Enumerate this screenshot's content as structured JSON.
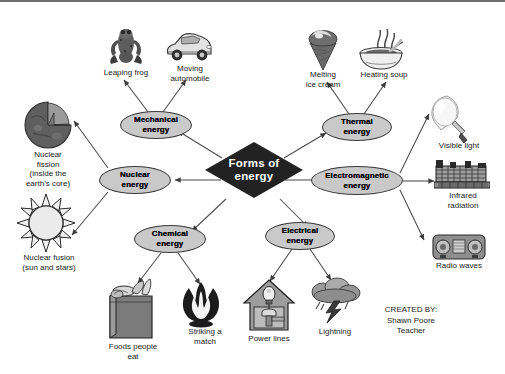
{
  "diagram": {
    "title": "Forms of energy",
    "center": {
      "label": "Forms of energy"
    },
    "branches": [
      {
        "id": "mechanical",
        "label": "Mechanical energy",
        "examples": [
          {
            "id": "leaping-frog",
            "caption": "Leaping frog",
            "icon": "frog-icon"
          },
          {
            "id": "moving-automobile",
            "caption": "Moving automobile",
            "icon": "car-icon"
          }
        ]
      },
      {
        "id": "thermal",
        "label": "Thermal energy",
        "examples": [
          {
            "id": "melting-ice-cream",
            "caption": "Melting ice cream",
            "icon": "ice-cream-cone-icon"
          },
          {
            "id": "heating-soup",
            "caption": "Heating soup",
            "icon": "soup-bowl-icon"
          }
        ]
      },
      {
        "id": "nuclear",
        "label": "Nuclear energy",
        "examples": [
          {
            "id": "nuclear-fission",
            "caption": "Nuclear fission (inside the earth's core)",
            "icon": "earth-cutaway-icon"
          },
          {
            "id": "nuclear-fusion",
            "caption": "Nuclear fusion (sun and stars)",
            "icon": "sun-icon"
          }
        ]
      },
      {
        "id": "electromagnetic",
        "label": "Electromagnetic energy",
        "examples": [
          {
            "id": "visible-light",
            "caption": "Visible light",
            "icon": "light-bulb-icon"
          },
          {
            "id": "infrared-radiation",
            "caption": "Infrared radiation",
            "icon": "space-heater-icon"
          },
          {
            "id": "radio-waves",
            "caption": "Radio waves",
            "icon": "radio-icon"
          }
        ]
      },
      {
        "id": "chemical",
        "label": "Chemical energy",
        "examples": [
          {
            "id": "foods-people-eat",
            "caption": "Foods people eat",
            "icon": "grocery-bag-icon"
          },
          {
            "id": "striking-a-match",
            "caption": "Striking a match",
            "icon": "flame-icon"
          }
        ]
      },
      {
        "id": "electrical",
        "label": "Electrical energy",
        "examples": [
          {
            "id": "power-lines",
            "caption": "Power lines",
            "icon": "house-wiring-icon"
          },
          {
            "id": "lightning",
            "caption": "Lightning",
            "icon": "storm-cloud-lightning-icon"
          }
        ]
      }
    ],
    "labels": {
      "mechanical_line1": "Mechanical",
      "mechanical_line2": "energy",
      "thermal_line1": "Thermal",
      "thermal_line2": "energy",
      "nuclear_line1": "Nuclear",
      "nuclear_line2": "energy",
      "electromagnetic_line1": "Electromagnetic",
      "electromagnetic_line2": "energy",
      "chemical_line1": "Chemical",
      "chemical_line2": "energy",
      "electrical_line1": "Electrical",
      "electrical_line2": "energy",
      "center_line1": "Forms of",
      "center_line2": "energy"
    },
    "captions": {
      "leaping_frog": "Leaping frog",
      "moving_automobile_line1": "Moving",
      "moving_automobile_line2": "automobile",
      "melting_ice_cream_line1": "Melting",
      "melting_ice_cream_line2": "ice cream",
      "heating_soup": "Heating soup",
      "nuclear_fission_line1": "Nuclear",
      "nuclear_fission_line2": "fission",
      "nuclear_fission_line3": "(inside the",
      "nuclear_fission_line4": "earth's core)",
      "nuclear_fusion_line1": "Nuclear fusion",
      "nuclear_fusion_line2": "(sun and stars)",
      "visible_light": "Visible light",
      "infrared_line1": "Infrared",
      "infrared_line2": "radiation",
      "radio_waves": "Radio waves",
      "foods_line1": "Foods people",
      "foods_line2": "eat",
      "match_line1": "Striking a",
      "match_line2": "match",
      "power_lines": "Power lines",
      "lightning": "Lightning"
    },
    "credit": {
      "line1": "CREATED BY:",
      "line2": "Shawn Poore",
      "line3": "Teacher"
    },
    "colors": {
      "center_fill": "#222222",
      "center_text": "#ffffff",
      "ellipse_fill": "#c9c9c9",
      "ellipse_stroke": "#3a3a3a",
      "background": "#ffffff",
      "connector": "#4a4a4a",
      "caption_text": "#1c1c1c"
    }
  }
}
